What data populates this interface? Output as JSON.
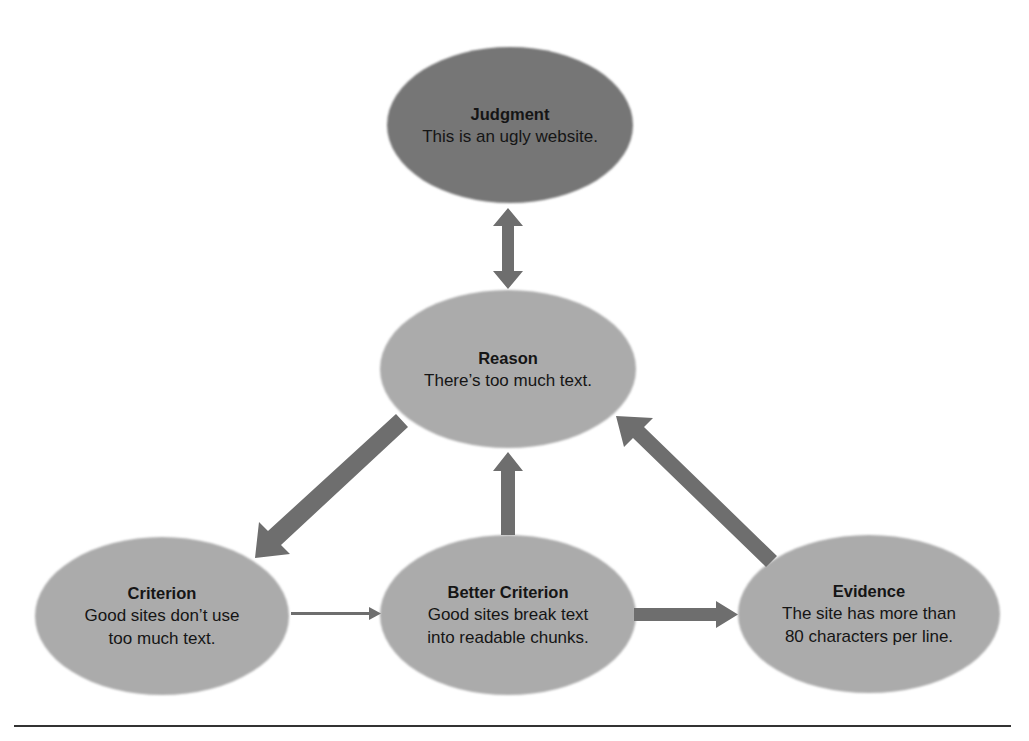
{
  "colors": {
    "judgment_fill": "#767676",
    "node_fill": "#ababab",
    "arrow": "#6e6e6e",
    "text": "#151515",
    "rule": "#333333"
  },
  "nodes": {
    "judgment": {
      "title": "Judgment",
      "lines": [
        "This is an ugly website."
      ]
    },
    "reason": {
      "title": "Reason",
      "lines": [
        "There’s too much text."
      ]
    },
    "criterion": {
      "title": "Criterion",
      "lines": [
        "Good sites don’t use",
        "too much text."
      ]
    },
    "better_criterion": {
      "title": "Better Criterion",
      "lines": [
        "Good sites break text",
        "into readable chunks."
      ]
    },
    "evidence": {
      "title": "Evidence",
      "lines": [
        "The site has more than",
        "80 characters per line."
      ]
    }
  },
  "edges": [
    {
      "from": "judgment",
      "to": "reason",
      "type": "bidirectional"
    },
    {
      "from": "reason",
      "to": "criterion",
      "type": "thick"
    },
    {
      "from": "better_criterion",
      "to": "reason",
      "type": "thick"
    },
    {
      "from": "evidence",
      "to": "reason",
      "type": "thick"
    },
    {
      "from": "criterion",
      "to": "better_criterion",
      "type": "thin"
    },
    {
      "from": "better_criterion",
      "to": "evidence",
      "type": "thick"
    }
  ]
}
